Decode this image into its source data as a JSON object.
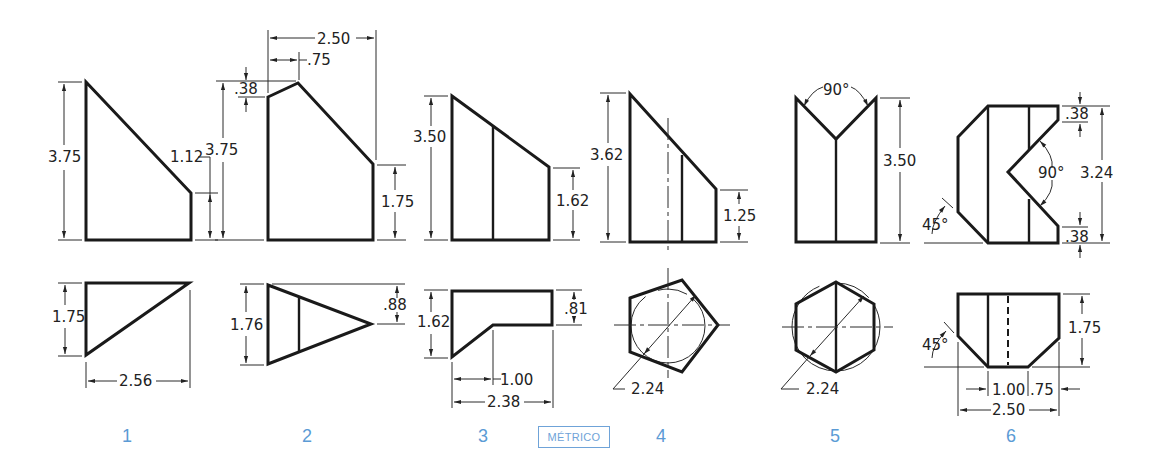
{
  "badge": {
    "label": "MÉTRICO",
    "color": "#6fa3d8"
  },
  "colors": {
    "line": "#1a1a1a",
    "label": "#5b9bd5",
    "background": "#ffffff"
  },
  "figures": [
    {
      "number": "1",
      "front_view": {
        "dims": {
          "total_height": "3.75",
          "right_height": "1.12"
        }
      },
      "top_view": {
        "dims": {
          "depth": "1.75",
          "width": "2.56"
        }
      }
    },
    {
      "number": "2",
      "front_view": {
        "dims": {
          "total_width": "2.50",
          "peak_offset": ".75",
          "peak_rise": ".38",
          "total_height": "3.75",
          "right_height": "1.75"
        }
      },
      "top_view": {
        "dims": {
          "depth": "1.76",
          "apex_offset": ".88"
        }
      }
    },
    {
      "number": "3",
      "front_view": {
        "dims": {
          "total_height": "3.50",
          "right_height": "1.62"
        }
      },
      "top_view": {
        "dims": {
          "depth": "1.62",
          "right_depth": ".81",
          "notch_width": "1.00",
          "width": "2.38"
        }
      }
    },
    {
      "number": "4",
      "front_view": {
        "dims": {
          "total_height": "3.62",
          "right_height": "1.25"
        }
      },
      "top_view": {
        "dims": {
          "diameter": "2.24"
        },
        "shape": "pentagon"
      }
    },
    {
      "number": "5",
      "front_view": {
        "dims": {
          "angle": "90°",
          "total_height": "3.50"
        }
      },
      "top_view": {
        "dims": {
          "diameter": "2.24"
        },
        "shape": "hexagon"
      }
    },
    {
      "number": "6",
      "front_view": {
        "dims": {
          "top_offset": ".38",
          "bottom_offset": ".38",
          "angle_v": "90°",
          "total_height": "3.24",
          "chamfer_angle": "45°"
        }
      },
      "top_view": {
        "dims": {
          "depth": "1.75",
          "chamfer_angle": "45°",
          "center_width": "1.00",
          "right_offset": ".75",
          "width": "2.50"
        }
      }
    }
  ]
}
